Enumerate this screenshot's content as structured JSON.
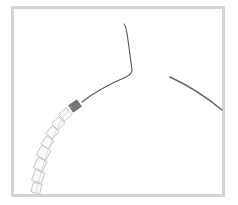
{
  "image": {
    "subject": "jewelry hoop wire with beads",
    "frame_color": "#d4d4d4",
    "background": "#ffffff",
    "wire_color": "#555555",
    "bead_outline_color": "#b8b8b8",
    "crimp_color": "#6a6a6a"
  }
}
